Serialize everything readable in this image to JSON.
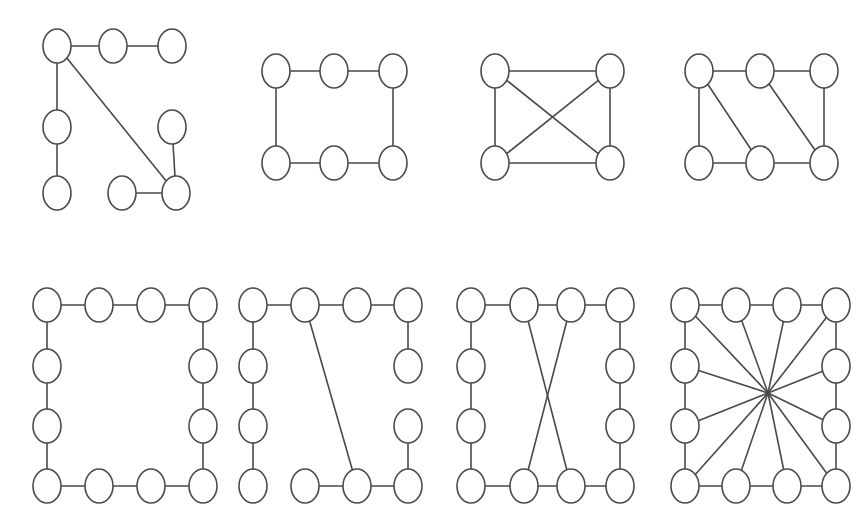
{
  "figure": {
    "title": "",
    "background_color": "#ffffff",
    "stroke_color": "#4a4a4a",
    "node_fill_color": "#ffffff",
    "node_stroke_width": 1.6,
    "edge_stroke_width": 1.6,
    "width": 867,
    "height": 518,
    "node_rx": 14,
    "node_ry": 17
  },
  "chart_data": {
    "type": "diagram",
    "subtype": "node-link-graphs",
    "title": "",
    "xlabel": "",
    "ylabel": "",
    "grid": false,
    "legend": "none",
    "panel_layout": {
      "rows": 2,
      "cols": 4
    },
    "graphs": [
      {
        "id": "graph-1",
        "label": "",
        "row": 0,
        "col": 0,
        "node_count": 8,
        "edge_count": 7,
        "nodes": [
          {
            "id": "n0",
            "x": 57,
            "y": 46
          },
          {
            "id": "n1",
            "x": 113,
            "y": 46
          },
          {
            "id": "n2",
            "x": 172,
            "y": 46
          },
          {
            "id": "n3",
            "x": 57,
            "y": 127
          },
          {
            "id": "n4",
            "x": 172,
            "y": 127
          },
          {
            "id": "n5",
            "x": 57,
            "y": 193
          },
          {
            "id": "n6",
            "x": 122,
            "y": 193
          },
          {
            "id": "n7",
            "x": 176,
            "y": 193
          }
        ],
        "edges": [
          [
            "n0",
            "n1"
          ],
          [
            "n1",
            "n2"
          ],
          [
            "n0",
            "n3"
          ],
          [
            "n3",
            "n5"
          ],
          [
            "n0",
            "n7"
          ],
          [
            "n4",
            "n7"
          ],
          [
            "n6",
            "n7"
          ]
        ]
      },
      {
        "id": "graph-2",
        "label": "",
        "row": 0,
        "col": 1,
        "node_count": 6,
        "edge_count": 6,
        "nodes": [
          {
            "id": "n0",
            "x": 276,
            "y": 71
          },
          {
            "id": "n1",
            "x": 334,
            "y": 71
          },
          {
            "id": "n2",
            "x": 393,
            "y": 71
          },
          {
            "id": "n3",
            "x": 276,
            "y": 163
          },
          {
            "id": "n4",
            "x": 334,
            "y": 163
          },
          {
            "id": "n5",
            "x": 393,
            "y": 163
          }
        ],
        "edges": [
          [
            "n0",
            "n1"
          ],
          [
            "n1",
            "n2"
          ],
          [
            "n2",
            "n5"
          ],
          [
            "n5",
            "n4"
          ],
          [
            "n4",
            "n3"
          ],
          [
            "n3",
            "n0"
          ]
        ]
      },
      {
        "id": "graph-3",
        "label": "",
        "row": 0,
        "col": 2,
        "node_count": 4,
        "edge_count": 6,
        "nodes": [
          {
            "id": "n0",
            "x": 495,
            "y": 71
          },
          {
            "id": "n1",
            "x": 610,
            "y": 71
          },
          {
            "id": "n2",
            "x": 495,
            "y": 163
          },
          {
            "id": "n3",
            "x": 610,
            "y": 163
          }
        ],
        "edges": [
          [
            "n0",
            "n1"
          ],
          [
            "n0",
            "n2"
          ],
          [
            "n1",
            "n3"
          ],
          [
            "n2",
            "n3"
          ],
          [
            "n0",
            "n3"
          ],
          [
            "n1",
            "n2"
          ]
        ]
      },
      {
        "id": "graph-4",
        "label": "",
        "row": 0,
        "col": 3,
        "node_count": 6,
        "edge_count": 8,
        "nodes": [
          {
            "id": "n0",
            "x": 699,
            "y": 71
          },
          {
            "id": "n1",
            "x": 760,
            "y": 71
          },
          {
            "id": "n2",
            "x": 824,
            "y": 71
          },
          {
            "id": "n3",
            "x": 699,
            "y": 163
          },
          {
            "id": "n4",
            "x": 760,
            "y": 163
          },
          {
            "id": "n5",
            "x": 824,
            "y": 163
          }
        ],
        "edges": [
          [
            "n0",
            "n1"
          ],
          [
            "n1",
            "n2"
          ],
          [
            "n3",
            "n4"
          ],
          [
            "n4",
            "n5"
          ],
          [
            "n0",
            "n3"
          ],
          [
            "n2",
            "n5"
          ],
          [
            "n0",
            "n4"
          ],
          [
            "n1",
            "n5"
          ]
        ]
      },
      {
        "id": "graph-5",
        "label": "",
        "row": 1,
        "col": 0,
        "node_count": 12,
        "edge_count": 12,
        "nodes": [
          {
            "id": "n0",
            "x": 47,
            "y": 305
          },
          {
            "id": "n1",
            "x": 99,
            "y": 305
          },
          {
            "id": "n2",
            "x": 151,
            "y": 305
          },
          {
            "id": "n3",
            "x": 203,
            "y": 305
          },
          {
            "id": "n4",
            "x": 47,
            "y": 366
          },
          {
            "id": "n5",
            "x": 203,
            "y": 366
          },
          {
            "id": "n6",
            "x": 47,
            "y": 426
          },
          {
            "id": "n7",
            "x": 203,
            "y": 426
          },
          {
            "id": "n8",
            "x": 47,
            "y": 486
          },
          {
            "id": "n9",
            "x": 99,
            "y": 486
          },
          {
            "id": "n10",
            "x": 151,
            "y": 486
          },
          {
            "id": "n11",
            "x": 203,
            "y": 486
          }
        ],
        "edges": [
          [
            "n0",
            "n1"
          ],
          [
            "n1",
            "n2"
          ],
          [
            "n2",
            "n3"
          ],
          [
            "n3",
            "n5"
          ],
          [
            "n5",
            "n7"
          ],
          [
            "n7",
            "n11"
          ],
          [
            "n11",
            "n10"
          ],
          [
            "n10",
            "n9"
          ],
          [
            "n9",
            "n8"
          ],
          [
            "n8",
            "n6"
          ],
          [
            "n6",
            "n4"
          ],
          [
            "n4",
            "n0"
          ]
        ]
      },
      {
        "id": "graph-6",
        "label": "",
        "row": 1,
        "col": 1,
        "node_count": 12,
        "edge_count": 10,
        "nodes": [
          {
            "id": "n0",
            "x": 253,
            "y": 305
          },
          {
            "id": "n1",
            "x": 305,
            "y": 305
          },
          {
            "id": "n2",
            "x": 357,
            "y": 305
          },
          {
            "id": "n3",
            "x": 408,
            "y": 305
          },
          {
            "id": "n4",
            "x": 253,
            "y": 366
          },
          {
            "id": "n5",
            "x": 408,
            "y": 366
          },
          {
            "id": "n6",
            "x": 253,
            "y": 426
          },
          {
            "id": "n7",
            "x": 408,
            "y": 426
          },
          {
            "id": "n8",
            "x": 253,
            "y": 486
          },
          {
            "id": "n9",
            "x": 305,
            "y": 486
          },
          {
            "id": "n10",
            "x": 357,
            "y": 486
          },
          {
            "id": "n11",
            "x": 408,
            "y": 486
          }
        ],
        "edges": [
          [
            "n0",
            "n1"
          ],
          [
            "n1",
            "n2"
          ],
          [
            "n2",
            "n3"
          ],
          [
            "n3",
            "n5"
          ],
          [
            "n7",
            "n11"
          ],
          [
            "n11",
            "n10"
          ],
          [
            "n10",
            "n9"
          ],
          [
            "n8",
            "n6"
          ],
          [
            "n6",
            "n4"
          ],
          [
            "n4",
            "n0"
          ],
          [
            "n1",
            "n10"
          ]
        ]
      },
      {
        "id": "graph-7",
        "label": "",
        "row": 1,
        "col": 2,
        "node_count": 12,
        "edge_count": 14,
        "nodes": [
          {
            "id": "n0",
            "x": 471,
            "y": 305
          },
          {
            "id": "n1",
            "x": 524,
            "y": 305
          },
          {
            "id": "n2",
            "x": 571,
            "y": 305
          },
          {
            "id": "n3",
            "x": 620,
            "y": 305
          },
          {
            "id": "n4",
            "x": 471,
            "y": 366
          },
          {
            "id": "n5",
            "x": 620,
            "y": 366
          },
          {
            "id": "n6",
            "x": 471,
            "y": 426
          },
          {
            "id": "n7",
            "x": 620,
            "y": 426
          },
          {
            "id": "n8",
            "x": 471,
            "y": 486
          },
          {
            "id": "n9",
            "x": 524,
            "y": 486
          },
          {
            "id": "n10",
            "x": 571,
            "y": 486
          },
          {
            "id": "n11",
            "x": 620,
            "y": 486
          }
        ],
        "edges": [
          [
            "n0",
            "n1"
          ],
          [
            "n1",
            "n2"
          ],
          [
            "n2",
            "n3"
          ],
          [
            "n3",
            "n5"
          ],
          [
            "n5",
            "n7"
          ],
          [
            "n7",
            "n11"
          ],
          [
            "n11",
            "n10"
          ],
          [
            "n10",
            "n9"
          ],
          [
            "n9",
            "n8"
          ],
          [
            "n8",
            "n6"
          ],
          [
            "n6",
            "n4"
          ],
          [
            "n4",
            "n0"
          ],
          [
            "n1",
            "n10"
          ],
          [
            "n2",
            "n9"
          ]
        ]
      },
      {
        "id": "graph-8",
        "label": "",
        "row": 1,
        "col": 3,
        "node_count": 12,
        "edge_count": 24,
        "hub": {
          "id": "hub",
          "x": 768,
          "y": 393,
          "visible_node": false
        },
        "nodes": [
          {
            "id": "n0",
            "x": 685,
            "y": 305
          },
          {
            "id": "n1",
            "x": 736,
            "y": 305
          },
          {
            "id": "n2",
            "x": 787,
            "y": 305
          },
          {
            "id": "n3",
            "x": 836,
            "y": 305
          },
          {
            "id": "n4",
            "x": 685,
            "y": 366
          },
          {
            "id": "n5",
            "x": 836,
            "y": 366
          },
          {
            "id": "n6",
            "x": 685,
            "y": 426
          },
          {
            "id": "n7",
            "x": 836,
            "y": 426
          },
          {
            "id": "n8",
            "x": 685,
            "y": 486
          },
          {
            "id": "n9",
            "x": 736,
            "y": 486
          },
          {
            "id": "n10",
            "x": 787,
            "y": 486
          },
          {
            "id": "n11",
            "x": 836,
            "y": 486
          }
        ],
        "edges": [
          [
            "n0",
            "n1"
          ],
          [
            "n1",
            "n2"
          ],
          [
            "n2",
            "n3"
          ],
          [
            "n3",
            "n5"
          ],
          [
            "n5",
            "n7"
          ],
          [
            "n7",
            "n11"
          ],
          [
            "n11",
            "n10"
          ],
          [
            "n10",
            "n9"
          ],
          [
            "n9",
            "n8"
          ],
          [
            "n8",
            "n6"
          ],
          [
            "n6",
            "n4"
          ],
          [
            "n4",
            "n0"
          ],
          [
            "n0",
            "hub"
          ],
          [
            "n1",
            "hub"
          ],
          [
            "n2",
            "hub"
          ],
          [
            "n3",
            "hub"
          ],
          [
            "n4",
            "hub"
          ],
          [
            "n5",
            "hub"
          ],
          [
            "n6",
            "hub"
          ],
          [
            "n7",
            "hub"
          ],
          [
            "n8",
            "hub"
          ],
          [
            "n9",
            "hub"
          ],
          [
            "n10",
            "hub"
          ],
          [
            "n11",
            "hub"
          ]
        ]
      }
    ]
  }
}
